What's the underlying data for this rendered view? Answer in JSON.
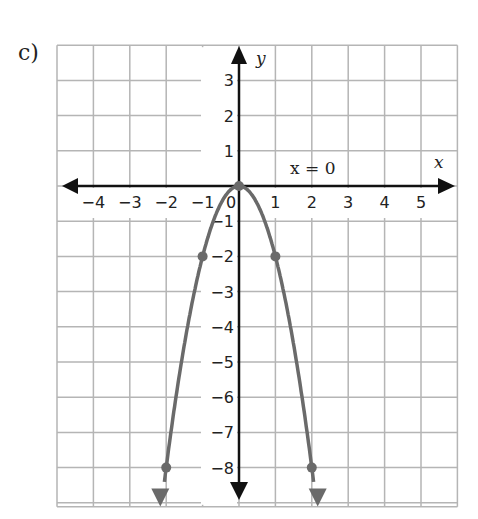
{
  "part_label": "c)",
  "annotation": "x = 0",
  "colors": {
    "grid": "#b5b5b5",
    "axis": "#111111",
    "curve": "#6a6a6a",
    "point": "#6a6a6a"
  },
  "chart_data": {
    "type": "line",
    "title": "",
    "xlabel": "x",
    "ylabel": "y",
    "xlim": [
      -5,
      6
    ],
    "ylim": [
      -9,
      4
    ],
    "grid": true,
    "x_ticks": [
      -4,
      -3,
      -2,
      -1,
      0,
      1,
      2,
      3,
      4,
      5
    ],
    "y_ticks": [
      3,
      2,
      1,
      -1,
      -2,
      -3,
      -4,
      -5,
      -6,
      -7,
      -8
    ],
    "annotations": [
      {
        "text": "x = 0",
        "x": 1.5,
        "y": 0.4,
        "meaning": "axis of symmetry"
      }
    ],
    "series": [
      {
        "name": "y = -2x^2",
        "points": [
          [
            -2,
            -8
          ],
          [
            -1,
            -2
          ],
          [
            0,
            0
          ],
          [
            1,
            2
          ],
          [
            2,
            -8
          ]
        ],
        "marked_points": [
          [
            -2,
            -8
          ],
          [
            -1,
            -2
          ],
          [
            0,
            0
          ],
          [
            1,
            -2
          ],
          [
            2,
            -8
          ]
        ],
        "arrows_at_ends": true
      }
    ]
  }
}
